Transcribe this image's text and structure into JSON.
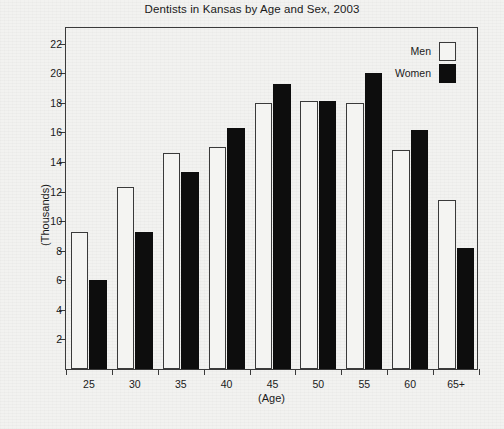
{
  "chart_data": {
    "type": "bar",
    "title": "Dentists in Kansas by Age and Sex, 2003",
    "xlabel": "(Age)",
    "ylabel": "(Thousands)",
    "categories": [
      "25",
      "30",
      "35",
      "40",
      "45",
      "50",
      "55",
      "60",
      "65+"
    ],
    "series": [
      {
        "name": "Men",
        "color": "#ffffff",
        "values": [
          9.3,
          12.3,
          14.6,
          15.0,
          18.0,
          18.1,
          18.0,
          14.8,
          11.4
        ]
      },
      {
        "name": "Women",
        "color": "#000000",
        "values": [
          6.0,
          9.3,
          13.3,
          16.3,
          19.3,
          18.1,
          20.0,
          16.2,
          8.2
        ]
      }
    ],
    "ylim": [
      0,
      23.2
    ],
    "yticks": [
      2,
      4,
      6,
      8,
      10,
      12,
      14,
      16,
      18,
      20,
      22
    ],
    "grid": false,
    "legend_position": "top-right",
    "legend": [
      "Men",
      "Women"
    ]
  }
}
